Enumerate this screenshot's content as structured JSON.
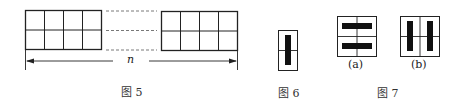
{
  "figures": {
    "fig5": {
      "caption": "图 5",
      "dimension_label": "n",
      "grid": {
        "rows": 2,
        "cols_left": 4,
        "cols_right": 4
      }
    },
    "fig6": {
      "caption": "图 6",
      "description": "1x2 tile with one vertical domino"
    },
    "fig7": {
      "caption": "图 7",
      "panels": [
        {
          "label": "(a)",
          "description": "2x2 with two horizontal dominoes"
        },
        {
          "label": "(b)",
          "description": "2x2 with two vertical dominoes"
        }
      ]
    }
  },
  "colors": {
    "line": "#222222",
    "fill": "#111111",
    "dash": "#555555"
  }
}
